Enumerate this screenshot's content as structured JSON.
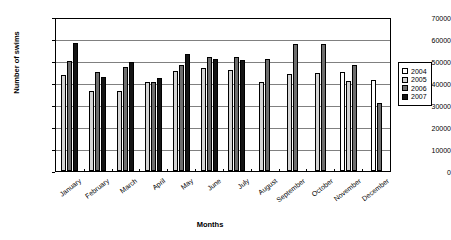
{
  "chart_data": {
    "type": "bar",
    "title": "",
    "xlabel": "Months",
    "ylabel": "Number of swims",
    "ylim": [
      0,
      70000
    ],
    "ytick_labels": [
      "70000",
      "60000",
      "50000",
      "40000",
      "30000",
      "20000",
      "10000",
      "0"
    ],
    "ytick_values": [
      70000,
      60000,
      50000,
      40000,
      30000,
      20000,
      10000,
      0
    ],
    "grid": true,
    "legend_position": "right",
    "categories": [
      "January",
      "February",
      "March",
      "April",
      "May",
      "June",
      "July",
      "August",
      "September",
      "October",
      "November",
      "December"
    ],
    "series": [
      {
        "name": "2004",
        "color": "#ffffff",
        "values": [
          null,
          null,
          null,
          null,
          null,
          null,
          null,
          null,
          null,
          null,
          45500,
          42000
        ]
      },
      {
        "name": "2005",
        "color": "#d4d4d4",
        "values": [
          44000,
          37000,
          37000,
          41000,
          46000,
          47500,
          46500,
          41000,
          44500,
          45000,
          41500,
          null
        ]
      },
      {
        "name": "2006",
        "color": "#6e6e6e",
        "values": [
          50500,
          45500,
          48000,
          41000,
          48800,
          52500,
          52500,
          51500,
          58500,
          58500,
          49000,
          31500
        ]
      },
      {
        "name": "2007",
        "color": "#141414",
        "values": [
          59000,
          43500,
          50000,
          43000,
          54000,
          51500,
          51000,
          null,
          null,
          null,
          null,
          null
        ]
      }
    ]
  }
}
